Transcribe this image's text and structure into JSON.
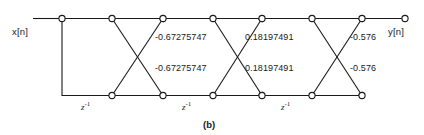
{
  "figure": {
    "caption": "(b)",
    "type": "lattice-filter-signal-flow-graph",
    "line_color": "#1a1a1a",
    "node_fill": "#ffffff",
    "background": "#ffffff"
  },
  "io": {
    "input_label": "x[n]",
    "output_label": "y[n]"
  },
  "stages": [
    {
      "index": 1,
      "upper_coefficient": "-0.67275747",
      "lower_coefficient": "-0.67275747",
      "delay_label_base": "z",
      "delay_label_exp": "-1"
    },
    {
      "index": 2,
      "upper_coefficient": "0.18197491",
      "lower_coefficient": "0.18197491",
      "delay_label_base": "z",
      "delay_label_exp": "-1"
    },
    {
      "index": 3,
      "upper_coefficient": "-0.576",
      "lower_coefficient": "-0.576",
      "delay_label_base": "z",
      "delay_label_exp": "-1"
    }
  ],
  "delays": [
    {
      "base": "z",
      "exp": "-1"
    },
    {
      "base": "z",
      "exp": "-1"
    },
    {
      "base": "z",
      "exp": "-1"
    }
  ],
  "coefficients": {
    "stage1_upper": "-0.67275747",
    "stage1_lower": "-0.67275747",
    "stage2_upper": "0.18197491",
    "stage2_lower": "0.18197491",
    "stage3_upper": "-0.576",
    "stage3_lower": "-0.576"
  }
}
